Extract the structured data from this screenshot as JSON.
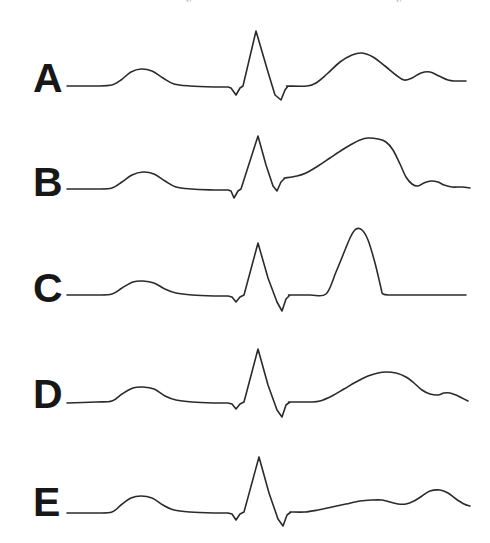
{
  "figure": {
    "background_color": "#ffffff",
    "trace_color": "#2b2b2b",
    "label_color": "#171717",
    "canvas": {
      "width": 490,
      "height": 543
    }
  },
  "top_artifacts": [
    {
      "text": "y",
      "x": 186,
      "y": -3
    },
    {
      "text": "y",
      "x": 396,
      "y": -3
    }
  ],
  "chart_data": {
    "type": "line",
    "subtitle": "",
    "xlabel": "",
    "ylabel": "",
    "grid": false,
    "legend_position": "left",
    "axis_ranges": {
      "x": [
        0,
        490
      ],
      "y": [
        0,
        543
      ]
    },
    "note": "Coordinates are in screenshot pixel space; y increases downward. Each series is one ECG beat with P wave, QRS complex, ST segment, T wave and (where present) U wave.",
    "series": [
      {
        "name": "A",
        "label": "A",
        "label_x": 33,
        "label_y": 60,
        "baseline_y": 86,
        "features": {
          "p_wave": {
            "onset_x": 112,
            "peak_x": 141,
            "peak_y": 69,
            "offset_x": 174,
            "amplitude": "small rounded"
          },
          "q_wave": {
            "x": 236,
            "y": 95
          },
          "r_wave": {
            "x": 256,
            "y": 31
          },
          "s_wave": {
            "x": 281,
            "y": 100
          },
          "st_segment": {
            "start_x": 287,
            "end_x": 307,
            "level_y": 86,
            "elevation": "isoelectric"
          },
          "t_wave": {
            "onset_x": 307,
            "peak_x": 360,
            "peak_y": 53,
            "offset_x": 403,
            "shape": "broad rounded, upright"
          },
          "u_wave": {
            "peak_x": 426,
            "peak_y": 72,
            "shape": "small rounded"
          }
        },
        "points": [
          [
            67,
            86
          ],
          [
            95,
            86
          ],
          [
            112,
            85
          ],
          [
            121,
            80
          ],
          [
            131,
            72
          ],
          [
            141,
            69
          ],
          [
            152,
            71
          ],
          [
            163,
            78
          ],
          [
            174,
            84
          ],
          [
            190,
            86
          ],
          [
            214,
            87
          ],
          [
            228,
            87
          ],
          [
            231,
            88
          ],
          [
            236,
            95
          ],
          [
            240,
            88
          ],
          [
            243,
            86
          ],
          [
            256,
            31
          ],
          [
            268,
            72
          ],
          [
            275,
            95
          ],
          [
            281,
            100
          ],
          [
            285,
            90
          ],
          [
            288,
            86
          ],
          [
            307,
            86
          ],
          [
            316,
            83
          ],
          [
            327,
            74
          ],
          [
            340,
            62
          ],
          [
            352,
            55
          ],
          [
            362,
            53
          ],
          [
            373,
            57
          ],
          [
            385,
            66
          ],
          [
            396,
            75
          ],
          [
            404,
            80
          ],
          [
            412,
            78
          ],
          [
            421,
            73
          ],
          [
            430,
            72
          ],
          [
            439,
            76
          ],
          [
            448,
            80
          ],
          [
            455,
            81
          ],
          [
            466,
            81
          ]
        ]
      },
      {
        "name": "B",
        "label": "B",
        "label_x": 33,
        "label_y": 164,
        "baseline_y": 189,
        "features": {
          "p_wave": {
            "onset_x": 112,
            "peak_x": 143,
            "peak_y": 172,
            "offset_x": 176,
            "amplitude": "small rounded"
          },
          "q_wave": {
            "x": 234,
            "y": 198
          },
          "r_wave": {
            "x": 258,
            "y": 136
          },
          "s_wave": {
            "x": 277,
            "y": 191
          },
          "st_segment": {
            "start_x": 285,
            "end_x": 300,
            "level_y": 178,
            "elevation": "elevated, coved"
          },
          "t_wave": {
            "onset_x": 300,
            "peak_x": 366,
            "peak_y": 138,
            "offset_x": 410,
            "shape": "broad elevated ST-T merged dome"
          },
          "u_wave": {
            "peak_x": 428,
            "peak_y": 180,
            "shape": "small rounded"
          }
        },
        "points": [
          [
            67,
            189
          ],
          [
            96,
            189
          ],
          [
            112,
            188
          ],
          [
            122,
            182
          ],
          [
            132,
            175
          ],
          [
            143,
            172
          ],
          [
            154,
            174
          ],
          [
            165,
            181
          ],
          [
            176,
            187
          ],
          [
            192,
            189
          ],
          [
            214,
            190
          ],
          [
            228,
            190
          ],
          [
            231,
            191
          ],
          [
            234,
            198
          ],
          [
            238,
            191
          ],
          [
            241,
            189
          ],
          [
            258,
            136
          ],
          [
            266,
            165
          ],
          [
            273,
            186
          ],
          [
            277,
            191
          ],
          [
            281,
            182
          ],
          [
            285,
            178
          ],
          [
            297,
            176
          ],
          [
            306,
            173
          ],
          [
            318,
            166
          ],
          [
            330,
            158
          ],
          [
            342,
            150
          ],
          [
            352,
            144
          ],
          [
            360,
            140
          ],
          [
            368,
            138
          ],
          [
            378,
            139
          ],
          [
            386,
            142
          ],
          [
            393,
            150
          ],
          [
            400,
            164
          ],
          [
            406,
            177
          ],
          [
            412,
            184
          ],
          [
            418,
            186
          ],
          [
            424,
            183
          ],
          [
            431,
            181
          ],
          [
            438,
            182
          ],
          [
            444,
            185
          ],
          [
            452,
            187
          ],
          [
            462,
            187
          ],
          [
            470,
            188
          ]
        ]
      },
      {
        "name": "C",
        "label": "C",
        "label_x": 33,
        "label_y": 270,
        "baseline_y": 295,
        "features": {
          "p_wave": {
            "onset_x": 112,
            "peak_x": 143,
            "peak_y": 281,
            "offset_x": 176,
            "amplitude": "small rounded"
          },
          "q_wave": {
            "x": 236,
            "y": 302
          },
          "r_wave": {
            "x": 258,
            "y": 243
          },
          "s_wave": {
            "x": 282,
            "y": 311
          },
          "st_segment": {
            "start_x": 288,
            "end_x": 326,
            "level_y": 295,
            "elevation": "isoelectric"
          },
          "t_wave": {
            "onset_x": 326,
            "peak_x": 356,
            "peak_y": 229,
            "offset_x": 383,
            "shape": "tall peaked, tented"
          },
          "u_wave": null
        },
        "points": [
          [
            67,
            295
          ],
          [
            96,
            295
          ],
          [
            112,
            294
          ],
          [
            122,
            288
          ],
          [
            133,
            282
          ],
          [
            143,
            281
          ],
          [
            154,
            283
          ],
          [
            165,
            289
          ],
          [
            176,
            293
          ],
          [
            192,
            295
          ],
          [
            214,
            296
          ],
          [
            228,
            296
          ],
          [
            232,
            297
          ],
          [
            236,
            302
          ],
          [
            240,
            297
          ],
          [
            244,
            295
          ],
          [
            258,
            243
          ],
          [
            268,
            278
          ],
          [
            277,
            302
          ],
          [
            282,
            311
          ],
          [
            286,
            299
          ],
          [
            290,
            295
          ],
          [
            310,
            295
          ],
          [
            326,
            294
          ],
          [
            336,
            272
          ],
          [
            345,
            250
          ],
          [
            351,
            236
          ],
          [
            356,
            229
          ],
          [
            362,
            230
          ],
          [
            368,
            240
          ],
          [
            375,
            263
          ],
          [
            381,
            288
          ],
          [
            383,
            294
          ],
          [
            392,
            295
          ],
          [
            420,
            295
          ],
          [
            450,
            295
          ],
          [
            466,
            295
          ]
        ]
      },
      {
        "name": "D",
        "label": "D",
        "label_x": 33,
        "label_y": 376,
        "baseline_y": 402,
        "features": {
          "p_wave": {
            "onset_x": 112,
            "peak_x": 143,
            "peak_y": 387,
            "offset_x": 176,
            "amplitude": "small rounded"
          },
          "q_wave": {
            "x": 236,
            "y": 409
          },
          "r_wave": {
            "x": 258,
            "y": 349
          },
          "s_wave": {
            "x": 282,
            "y": 417
          },
          "st_segment": {
            "start_x": 288,
            "end_x": 320,
            "level_y": 402,
            "elevation": "isoelectric"
          },
          "t_wave": {
            "onset_x": 320,
            "peak_x": 383,
            "peak_y": 372,
            "offset_x": 432,
            "shape": "broad low rounded"
          },
          "u_wave": {
            "peak_x": 448,
            "peak_y": 393,
            "shape": "small notch"
          }
        },
        "points": [
          [
            67,
            403
          ],
          [
            96,
            402
          ],
          [
            112,
            401
          ],
          [
            122,
            394
          ],
          [
            133,
            388
          ],
          [
            143,
            387
          ],
          [
            154,
            389
          ],
          [
            165,
            396
          ],
          [
            176,
            400
          ],
          [
            192,
            402
          ],
          [
            214,
            403
          ],
          [
            228,
            403
          ],
          [
            232,
            404
          ],
          [
            236,
            409
          ],
          [
            240,
            404
          ],
          [
            244,
            402
          ],
          [
            258,
            349
          ],
          [
            268,
            385
          ],
          [
            277,
            410
          ],
          [
            282,
            417
          ],
          [
            286,
            405
          ],
          [
            290,
            402
          ],
          [
            310,
            402
          ],
          [
            320,
            401
          ],
          [
            332,
            396
          ],
          [
            344,
            389
          ],
          [
            356,
            382
          ],
          [
            368,
            376
          ],
          [
            378,
            373
          ],
          [
            386,
            372
          ],
          [
            396,
            373
          ],
          [
            406,
            377
          ],
          [
            414,
            383
          ],
          [
            422,
            390
          ],
          [
            430,
            394
          ],
          [
            438,
            395
          ],
          [
            444,
            393
          ],
          [
            450,
            393
          ],
          [
            456,
            395
          ],
          [
            462,
            398
          ],
          [
            468,
            401
          ]
        ]
      },
      {
        "name": "E",
        "label": "E",
        "label_x": 33,
        "label_y": 484,
        "baseline_y": 512,
        "features": {
          "p_wave": {
            "onset_x": 112,
            "peak_x": 141,
            "peak_y": 496,
            "offset_x": 174,
            "amplitude": "small rounded"
          },
          "q_wave": {
            "x": 236,
            "y": 520
          },
          "r_wave": {
            "x": 259,
            "y": 457
          },
          "s_wave": {
            "x": 283,
            "y": 526
          },
          "st_segment": {
            "start_x": 289,
            "end_x": 310,
            "level_y": 512,
            "elevation": "isoelectric"
          },
          "t_wave": {
            "onset_x": 310,
            "peak_x": 378,
            "peak_y": 500,
            "offset_x": 412,
            "shape": "flattened low amplitude"
          },
          "u_wave": {
            "peak_x": 440,
            "peak_y": 490,
            "shape": "prominent rounded"
          }
        },
        "points": [
          [
            67,
            513
          ],
          [
            96,
            513
          ],
          [
            112,
            512
          ],
          [
            121,
            505
          ],
          [
            131,
            498
          ],
          [
            141,
            496
          ],
          [
            152,
            498
          ],
          [
            163,
            505
          ],
          [
            174,
            510
          ],
          [
            190,
            512
          ],
          [
            214,
            513
          ],
          [
            228,
            513
          ],
          [
            232,
            514
          ],
          [
            236,
            520
          ],
          [
            240,
            514
          ],
          [
            244,
            512
          ],
          [
            259,
            457
          ],
          [
            269,
            493
          ],
          [
            278,
            519
          ],
          [
            283,
            526
          ],
          [
            287,
            515
          ],
          [
            291,
            512
          ],
          [
            305,
            512
          ],
          [
            318,
            510
          ],
          [
            332,
            507
          ],
          [
            346,
            504
          ],
          [
            360,
            501
          ],
          [
            372,
            500
          ],
          [
            382,
            500
          ],
          [
            390,
            502
          ],
          [
            398,
            504
          ],
          [
            406,
            504
          ],
          [
            414,
            501
          ],
          [
            422,
            496
          ],
          [
            430,
            491
          ],
          [
            440,
            490
          ],
          [
            448,
            493
          ],
          [
            456,
            499
          ],
          [
            464,
            504
          ],
          [
            470,
            506
          ]
        ]
      }
    ]
  }
}
